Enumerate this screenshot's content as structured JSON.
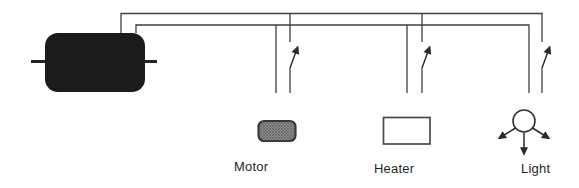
{
  "diagram": {
    "labels": {
      "motor": "Motor",
      "heater": "Heater",
      "light": "Light"
    },
    "switch_states": {
      "motor": "open",
      "heater": "open",
      "light": "open"
    },
    "colors": {
      "background": "#ffffff",
      "wire": "#3f3f3f",
      "arrowhead": "#2b2b2b",
      "power_supply_fill": "#1b1b1b",
      "motor_fill": "#8c8c8c",
      "motor_hatch": "#636363",
      "motor_border": "#3a3a3a",
      "heater_border": "#4a4a4a",
      "light_border": "#333333",
      "label_text": "#1f1f1f"
    }
  }
}
